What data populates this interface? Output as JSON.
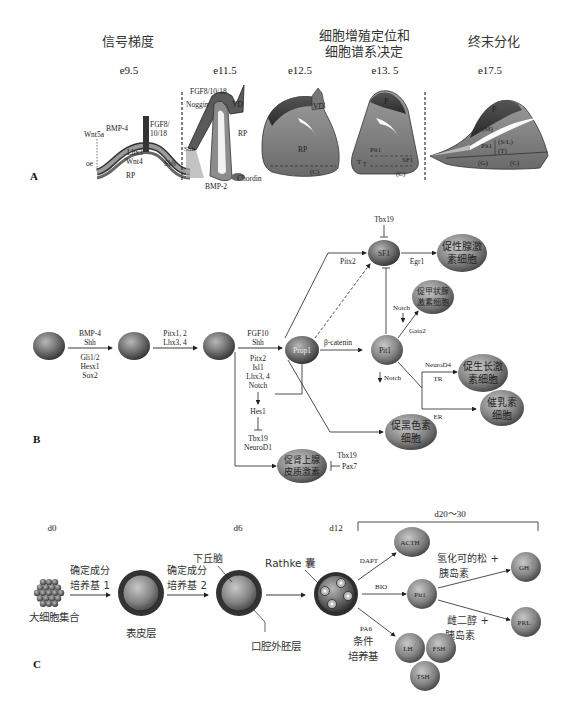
{
  "panel_a": {
    "label": "A",
    "headers": [
      "信号梯度",
      "细胞增殖定位和",
      "细胞谱系决定",
      "终末分化"
    ],
    "stages": [
      "e9.5",
      "e11.5",
      "e12.5",
      "e13. 5",
      "e17.5"
    ],
    "e95_labels": [
      "Wnt5a",
      "BMP-4",
      "FGF8/",
      "10/18",
      "Lhx3",
      "Wnt4",
      "oe",
      "Shh",
      "RP"
    ],
    "e115_labels": [
      "FGF8/10/18",
      "Noggin",
      "VD",
      "RP",
      "Shh",
      "BMP-2",
      "Chordin"
    ],
    "e125_labels": [
      "VD",
      "RP",
      "(C)"
    ],
    "e135_labels": [
      "P",
      "Pit1",
      "T",
      "T",
      "SF1",
      "(C)"
    ],
    "e175_labels": [
      "P",
      "(M)",
      "Pit1",
      "(S/L)",
      "(T)",
      "(G)",
      "(C)"
    ]
  },
  "panel_b": {
    "label": "B",
    "step1_top": [
      "BMP-4",
      "Shh"
    ],
    "step1_bottom": [
      "Gli1/2",
      "Hesx1",
      "Sox2"
    ],
    "step2_top": [
      "Pitx1, 2",
      "Lhx3, 4"
    ],
    "step3_top": [
      "FGF10",
      "Shh"
    ],
    "step3_bottom": [
      "Pitx2",
      "Isl1",
      "Lhx3, 4",
      "Notch"
    ],
    "hes": "Hes1",
    "tbx_neuro": [
      "Tbx19",
      "NeuroD1"
    ],
    "prop1": "Prop1",
    "beta_catenin": "β-catenin",
    "pit1": "Pit1",
    "pit1_sup": "+",
    "sf1": "SF1",
    "tbx19_top": "Tbx19",
    "pitx2": "Pitx2",
    "egr1": "Egr1",
    "notch1": "Notch",
    "gata2": "Gata2",
    "notch2": "Notch",
    "neurod4": "NeuroD4",
    "tr": "TR",
    "er": "ER",
    "tbx19_low": "Tbx19",
    "pax7": "Pax7",
    "cells": {
      "gonadotroph": [
        "促性腺激",
        "素细胞"
      ],
      "thyrotroph": [
        "促甲状腺",
        "激素细胞"
      ],
      "somatotroph": [
        "促生长激",
        "素细胞"
      ],
      "lactotroph": [
        "催乳素",
        "细胞"
      ],
      "melanotroph": [
        "促黑色素",
        "细胞"
      ],
      "corticotroph": [
        "促肾上腺",
        "皮质激素"
      ]
    }
  },
  "panel_c": {
    "label": "C",
    "days": [
      "d0",
      "d6",
      "d12",
      "d20～30"
    ],
    "medium1": [
      "确定成分",
      "培养基 1"
    ],
    "medium2": [
      "确定成分",
      "培养基 2"
    ],
    "aggregate": "大细胞集合",
    "epidermis": "表皮层",
    "hypothalamus": "下丘脑",
    "oral_ectoderm": "口腔外胚层",
    "rathke": "Rathke 囊",
    "dapt": "DAPT",
    "bio": "BIO",
    "pa6": "PA6",
    "conditioned": [
      "条件",
      "培养基"
    ],
    "hydro": [
      "氢化可的松 +",
      "胰岛素"
    ],
    "estra": [
      "雌二醇 +",
      "胰岛素"
    ],
    "cells": {
      "acth": "ACTH",
      "pit1": "Pit1",
      "gh": "GH",
      "prl": "PRL",
      "lh": "LH",
      "fsh": "FSH",
      "tsh": "TSH"
    },
    "sup": "+"
  }
}
